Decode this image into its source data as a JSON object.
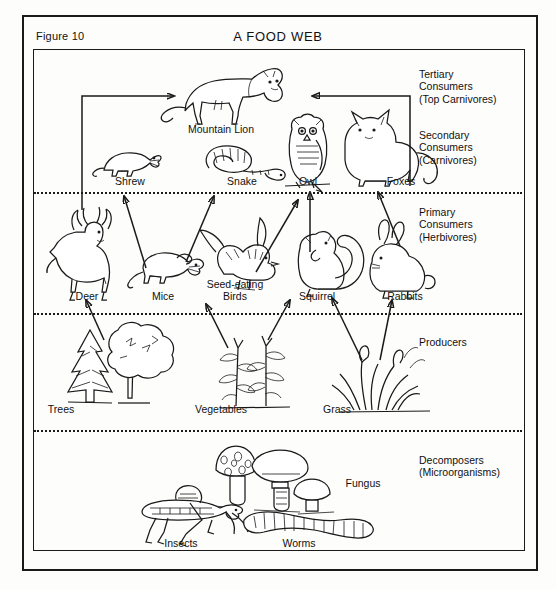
{
  "figure": {
    "label": "Figure 10",
    "title": "A FOOD WEB"
  },
  "tiers": [
    {
      "id": "tertiary",
      "label": "Tertiary\nConsumers\n(Top Carnivores)"
    },
    {
      "id": "secondary",
      "label": "Secondary\nConsumers\n(Carnivores)"
    },
    {
      "id": "primary",
      "label": "Primary\nConsumers\n(Herbivores)"
    },
    {
      "id": "producers",
      "label": "Producers"
    },
    {
      "id": "decomposers",
      "label": "Decomposers\n(Microorganisms)"
    }
  ],
  "organisms": {
    "tertiary": [
      {
        "id": "mountain-lion",
        "label": "Mountain Lion"
      }
    ],
    "secondary": [
      {
        "id": "shrew",
        "label": "Shrew"
      },
      {
        "id": "snake",
        "label": "Snake"
      },
      {
        "id": "owl",
        "label": "Owl"
      },
      {
        "id": "foxes",
        "label": "Foxes"
      }
    ],
    "primary": [
      {
        "id": "deer",
        "label": "Deer"
      },
      {
        "id": "mice",
        "label": "Mice"
      },
      {
        "id": "seed-eating-birds",
        "label": "Seed-eating\nBirds"
      },
      {
        "id": "squirrel",
        "label": "Squirrel"
      },
      {
        "id": "rabbits",
        "label": "Rabbits"
      }
    ],
    "producers": [
      {
        "id": "trees",
        "label": "Trees"
      },
      {
        "id": "vegetables",
        "label": "Vegetables"
      },
      {
        "id": "grass",
        "label": "Grass"
      }
    ],
    "decomposers": [
      {
        "id": "insects",
        "label": "Insects"
      },
      {
        "id": "fungus",
        "label": "Fungus"
      },
      {
        "id": "worms",
        "label": "Worms"
      }
    ]
  },
  "colors": {
    "ink": "#1a1a1a",
    "paper": "#fdfdfc"
  }
}
